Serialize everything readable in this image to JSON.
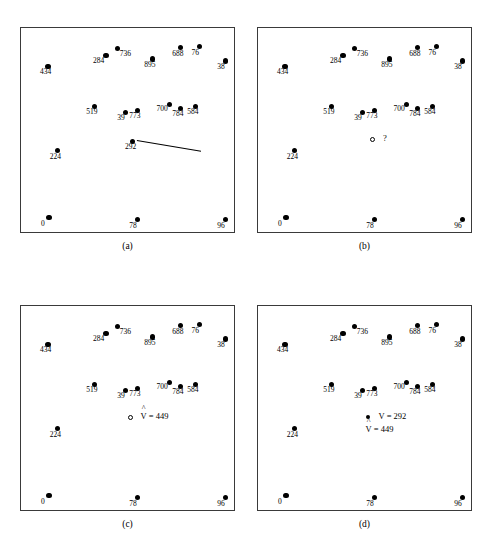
{
  "figure": {
    "panels": [
      {
        "id": "a",
        "caption": "(a)",
        "points": [
          {
            "label": "434",
            "x": 0.13,
            "y": 0.19,
            "marker": "filled",
            "pos": "below"
          },
          {
            "label": "284",
            "x": 0.4,
            "y": 0.14,
            "marker": "filled",
            "pos": "bl"
          },
          {
            "label": "736",
            "x": 0.455,
            "y": 0.105,
            "marker": "filled",
            "pos": "br"
          },
          {
            "label": "895",
            "x": 0.615,
            "y": 0.155,
            "marker": "filled",
            "pos": "below"
          },
          {
            "label": "688",
            "x": 0.745,
            "y": 0.1,
            "marker": "filled",
            "pos": "below"
          },
          {
            "label": "76",
            "x": 0.835,
            "y": 0.095,
            "marker": "filled",
            "pos": "below"
          },
          {
            "label": "38",
            "x": 0.955,
            "y": 0.165,
            "marker": "filled",
            "pos": "below"
          },
          {
            "label": "519",
            "x": 0.345,
            "y": 0.385,
            "marker": "filled",
            "pos": "below"
          },
          {
            "label": "39",
            "x": 0.49,
            "y": 0.415,
            "marker": "filled",
            "pos": "below"
          },
          {
            "label": "773",
            "x": 0.545,
            "y": 0.405,
            "marker": "filled",
            "pos": "below"
          },
          {
            "label": "700",
            "x": 0.695,
            "y": 0.375,
            "marker": "filled",
            "pos": "bl"
          },
          {
            "label": "784",
            "x": 0.745,
            "y": 0.395,
            "marker": "filled",
            "pos": "below"
          },
          {
            "label": "584",
            "x": 0.815,
            "y": 0.385,
            "marker": "filled",
            "pos": "below"
          },
          {
            "label": "292",
            "x": 0.525,
            "y": 0.555,
            "marker": "filled",
            "pos": "below"
          },
          {
            "label": "224",
            "x": 0.175,
            "y": 0.6,
            "marker": "filled",
            "pos": "below"
          },
          {
            "label": "0",
            "x": 0.135,
            "y": 0.925,
            "marker": "filled",
            "pos": "below"
          },
          {
            "label": "78",
            "x": 0.545,
            "y": 0.935,
            "marker": "filled",
            "pos": "below"
          },
          {
            "label": "96",
            "x": 0.955,
            "y": 0.935,
            "marker": "filled",
            "pos": "below"
          }
        ],
        "leader_line": {
          "x1": 0.545,
          "y1": 0.548,
          "x2": 0.845,
          "y2": 0.6
        },
        "annotations": []
      },
      {
        "id": "b",
        "caption": "(b)",
        "points": [
          {
            "label": "434",
            "x": 0.13,
            "y": 0.19,
            "marker": "filled",
            "pos": "below"
          },
          {
            "label": "284",
            "x": 0.4,
            "y": 0.14,
            "marker": "filled",
            "pos": "bl"
          },
          {
            "label": "736",
            "x": 0.455,
            "y": 0.105,
            "marker": "filled",
            "pos": "br"
          },
          {
            "label": "895",
            "x": 0.615,
            "y": 0.155,
            "marker": "filled",
            "pos": "below"
          },
          {
            "label": "688",
            "x": 0.745,
            "y": 0.1,
            "marker": "filled",
            "pos": "below"
          },
          {
            "label": "76",
            "x": 0.835,
            "y": 0.095,
            "marker": "filled",
            "pos": "below"
          },
          {
            "label": "38",
            "x": 0.955,
            "y": 0.165,
            "marker": "filled",
            "pos": "below"
          },
          {
            "label": "519",
            "x": 0.345,
            "y": 0.385,
            "marker": "filled",
            "pos": "below"
          },
          {
            "label": "39",
            "x": 0.49,
            "y": 0.415,
            "marker": "filled",
            "pos": "below"
          },
          {
            "label": "773",
            "x": 0.545,
            "y": 0.405,
            "marker": "filled",
            "pos": "below"
          },
          {
            "label": "700",
            "x": 0.695,
            "y": 0.375,
            "marker": "filled",
            "pos": "bl"
          },
          {
            "label": "784",
            "x": 0.745,
            "y": 0.395,
            "marker": "filled",
            "pos": "below"
          },
          {
            "label": "584",
            "x": 0.815,
            "y": 0.385,
            "marker": "filled",
            "pos": "below"
          },
          {
            "label": "224",
            "x": 0.175,
            "y": 0.6,
            "marker": "filled",
            "pos": "below"
          },
          {
            "label": "0",
            "x": 0.135,
            "y": 0.925,
            "marker": "filled",
            "pos": "below"
          },
          {
            "label": "78",
            "x": 0.545,
            "y": 0.935,
            "marker": "filled",
            "pos": "below"
          },
          {
            "label": "96",
            "x": 0.955,
            "y": 0.935,
            "marker": "filled",
            "pos": "below"
          }
        ],
        "leader_line": null,
        "annotations": [
          {
            "marker": "hollow",
            "x": 0.525,
            "y": 0.545,
            "text": "?",
            "hat": false
          }
        ]
      },
      {
        "id": "c",
        "caption": "(c)",
        "points": [
          {
            "label": "434",
            "x": 0.13,
            "y": 0.19,
            "marker": "filled",
            "pos": "below"
          },
          {
            "label": "284",
            "x": 0.4,
            "y": 0.14,
            "marker": "filled",
            "pos": "bl"
          },
          {
            "label": "736",
            "x": 0.455,
            "y": 0.105,
            "marker": "filled",
            "pos": "br"
          },
          {
            "label": "895",
            "x": 0.615,
            "y": 0.155,
            "marker": "filled",
            "pos": "below"
          },
          {
            "label": "688",
            "x": 0.745,
            "y": 0.1,
            "marker": "filled",
            "pos": "below"
          },
          {
            "label": "76",
            "x": 0.835,
            "y": 0.095,
            "marker": "filled",
            "pos": "below"
          },
          {
            "label": "38",
            "x": 0.955,
            "y": 0.165,
            "marker": "filled",
            "pos": "below"
          },
          {
            "label": "519",
            "x": 0.345,
            "y": 0.385,
            "marker": "filled",
            "pos": "below"
          },
          {
            "label": "39",
            "x": 0.49,
            "y": 0.415,
            "marker": "filled",
            "pos": "below"
          },
          {
            "label": "773",
            "x": 0.545,
            "y": 0.405,
            "marker": "filled",
            "pos": "below"
          },
          {
            "label": "700",
            "x": 0.695,
            "y": 0.375,
            "marker": "filled",
            "pos": "bl"
          },
          {
            "label": "784",
            "x": 0.745,
            "y": 0.395,
            "marker": "filled",
            "pos": "below"
          },
          {
            "label": "584",
            "x": 0.815,
            "y": 0.385,
            "marker": "filled",
            "pos": "below"
          },
          {
            "label": "224",
            "x": 0.175,
            "y": 0.6,
            "marker": "filled",
            "pos": "below"
          },
          {
            "label": "0",
            "x": 0.135,
            "y": 0.925,
            "marker": "filled",
            "pos": "below"
          },
          {
            "label": "78",
            "x": 0.545,
            "y": 0.935,
            "marker": "filled",
            "pos": "below"
          },
          {
            "label": "96",
            "x": 0.955,
            "y": 0.935,
            "marker": "filled",
            "pos": "below"
          }
        ],
        "leader_line": null,
        "annotations": [
          {
            "marker": "hollow",
            "x": 0.5,
            "y": 0.545,
            "text": "V = 449",
            "hat": true
          }
        ]
      },
      {
        "id": "d",
        "caption": "(d)",
        "points": [
          {
            "label": "434",
            "x": 0.13,
            "y": 0.19,
            "marker": "filled",
            "pos": "below"
          },
          {
            "label": "284",
            "x": 0.4,
            "y": 0.14,
            "marker": "filled",
            "pos": "bl"
          },
          {
            "label": "736",
            "x": 0.455,
            "y": 0.105,
            "marker": "filled",
            "pos": "br"
          },
          {
            "label": "895",
            "x": 0.615,
            "y": 0.155,
            "marker": "filled",
            "pos": "below"
          },
          {
            "label": "688",
            "x": 0.745,
            "y": 0.1,
            "marker": "filled",
            "pos": "below"
          },
          {
            "label": "76",
            "x": 0.835,
            "y": 0.095,
            "marker": "filled",
            "pos": "below"
          },
          {
            "label": "38",
            "x": 0.955,
            "y": 0.165,
            "marker": "filled",
            "pos": "below"
          },
          {
            "label": "519",
            "x": 0.345,
            "y": 0.385,
            "marker": "filled",
            "pos": "below"
          },
          {
            "label": "39",
            "x": 0.49,
            "y": 0.415,
            "marker": "filled",
            "pos": "below"
          },
          {
            "label": "773",
            "x": 0.545,
            "y": 0.405,
            "marker": "filled",
            "pos": "below"
          },
          {
            "label": "700",
            "x": 0.695,
            "y": 0.375,
            "marker": "filled",
            "pos": "bl"
          },
          {
            "label": "784",
            "x": 0.745,
            "y": 0.395,
            "marker": "filled",
            "pos": "below"
          },
          {
            "label": "584",
            "x": 0.815,
            "y": 0.385,
            "marker": "filled",
            "pos": "below"
          },
          {
            "label": "224",
            "x": 0.175,
            "y": 0.6,
            "marker": "filled",
            "pos": "below"
          },
          {
            "label": "0",
            "x": 0.135,
            "y": 0.925,
            "marker": "filled",
            "pos": "below"
          },
          {
            "label": "78",
            "x": 0.545,
            "y": 0.935,
            "marker": "filled",
            "pos": "below"
          },
          {
            "label": "96",
            "x": 0.955,
            "y": 0.935,
            "marker": "filled",
            "pos": "below"
          }
        ],
        "leader_line": null,
        "annotations": [
          {
            "marker": "filled",
            "x": 0.505,
            "y": 0.545,
            "text": "V = 292",
            "hat": false
          },
          {
            "marker": "none",
            "x": 0.505,
            "y": 0.605,
            "text": "V = 449",
            "hat": true
          }
        ]
      }
    ]
  },
  "chart_data": {
    "type": "scatter",
    "title": "",
    "xlabel": "",
    "ylabel": "",
    "xlim": [
      0,
      1
    ],
    "ylim": [
      0,
      1
    ],
    "grid": false,
    "legend": "none",
    "panel_captions": [
      "(a)",
      "(b)",
      "(c)",
      "(d)"
    ],
    "panels": [
      {
        "caption": "(a)",
        "labels": [
          "434",
          "284",
          "736",
          "895",
          "688",
          "76",
          "38",
          "519",
          "39",
          "773",
          "700",
          "784",
          "584",
          "292",
          "224",
          "0",
          "78",
          "96"
        ],
        "values": [
          434,
          284,
          736,
          895,
          688,
          76,
          38,
          519,
          39,
          773,
          700,
          784,
          584,
          292,
          224,
          0,
          78,
          96
        ],
        "x": [
          0.13,
          0.4,
          0.455,
          0.615,
          0.745,
          0.835,
          0.955,
          0.345,
          0.49,
          0.545,
          0.695,
          0.745,
          0.815,
          0.525,
          0.175,
          0.135,
          0.545,
          0.955
        ],
        "y": [
          0.81,
          0.86,
          0.895,
          0.845,
          0.9,
          0.905,
          0.835,
          0.615,
          0.585,
          0.595,
          0.625,
          0.605,
          0.615,
          0.445,
          0.4,
          0.075,
          0.065,
          0.065
        ],
        "annotations": []
      },
      {
        "caption": "(b)",
        "labels": [
          "434",
          "284",
          "736",
          "895",
          "688",
          "76",
          "38",
          "519",
          "39",
          "773",
          "700",
          "784",
          "584",
          "224",
          "0",
          "78",
          "96"
        ],
        "values": [
          434,
          284,
          736,
          895,
          688,
          76,
          38,
          519,
          39,
          773,
          700,
          784,
          584,
          224,
          0,
          78,
          96
        ],
        "x": [
          0.13,
          0.4,
          0.455,
          0.615,
          0.745,
          0.835,
          0.955,
          0.345,
          0.49,
          0.545,
          0.695,
          0.745,
          0.815,
          0.175,
          0.135,
          0.545,
          0.955
        ],
        "y": [
          0.81,
          0.86,
          0.895,
          0.845,
          0.9,
          0.905,
          0.835,
          0.615,
          0.585,
          0.595,
          0.625,
          0.605,
          0.615,
          0.4,
          0.075,
          0.065,
          0.065
        ],
        "annotations": [
          "?"
        ]
      },
      {
        "caption": "(c)",
        "labels": [
          "434",
          "284",
          "736",
          "895",
          "688",
          "76",
          "38",
          "519",
          "39",
          "773",
          "700",
          "784",
          "584",
          "224",
          "0",
          "78",
          "96"
        ],
        "values": [
          434,
          284,
          736,
          895,
          688,
          76,
          38,
          519,
          39,
          773,
          700,
          784,
          584,
          224,
          0,
          78,
          96
        ],
        "x": [
          0.13,
          0.4,
          0.455,
          0.615,
          0.745,
          0.835,
          0.955,
          0.345,
          0.49,
          0.545,
          0.695,
          0.745,
          0.815,
          0.175,
          0.135,
          0.545,
          0.955
        ],
        "y": [
          0.81,
          0.86,
          0.895,
          0.845,
          0.9,
          0.905,
          0.835,
          0.615,
          0.585,
          0.595,
          0.625,
          0.605,
          0.615,
          0.4,
          0.075,
          0.065,
          0.065
        ],
        "annotations": [
          "V-hat = 449"
        ]
      },
      {
        "caption": "(d)",
        "labels": [
          "434",
          "284",
          "736",
          "895",
          "688",
          "76",
          "38",
          "519",
          "39",
          "773",
          "700",
          "784",
          "584",
          "224",
          "0",
          "78",
          "96"
        ],
        "values": [
          434,
          284,
          736,
          895,
          688,
          76,
          38,
          519,
          39,
          773,
          700,
          784,
          584,
          224,
          0,
          78,
          96
        ],
        "x": [
          0.13,
          0.4,
          0.455,
          0.615,
          0.745,
          0.835,
          0.955,
          0.345,
          0.49,
          0.545,
          0.695,
          0.745,
          0.815,
          0.175,
          0.135,
          0.545,
          0.955
        ],
        "y": [
          0.81,
          0.86,
          0.895,
          0.845,
          0.9,
          0.905,
          0.835,
          0.615,
          0.585,
          0.595,
          0.625,
          0.605,
          0.615,
          0.4,
          0.075,
          0.065,
          0.065
        ],
        "annotations": [
          "V = 292",
          "V-hat = 449"
        ]
      }
    ]
  }
}
